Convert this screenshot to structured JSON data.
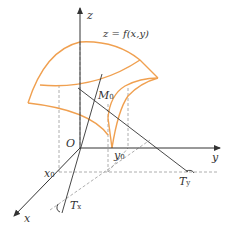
{
  "diagram": {
    "type": "3d-surface-tangent-lines",
    "colors": {
      "surface": "#f0a050",
      "axis": "#333333",
      "dashed": "#999999",
      "text": "#333333"
    },
    "labels": {
      "z_axis": "z",
      "y_axis": "y",
      "x_axis": "x",
      "origin": "O",
      "surface_eq": "z = f(x,y)",
      "point_M": "M",
      "point_M_sub": "0",
      "x0": "x",
      "x0_sub": "0",
      "y0": "y",
      "y0_sub": "0",
      "tangent_x": "T",
      "tangent_x_sub": "x",
      "tangent_y": "T",
      "tangent_y_sub": "y"
    }
  }
}
